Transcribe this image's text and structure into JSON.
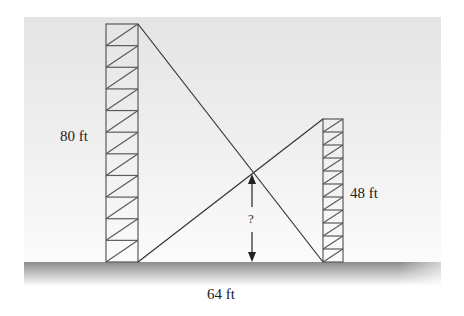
{
  "diagram": {
    "labels": {
      "left_tower_height": "80 ft",
      "right_tower_height": "48 ft",
      "ground_distance": "64 ft",
      "unknown_height": "?"
    },
    "values": {
      "left_tower_ft": 80,
      "right_tower_ft": 48,
      "distance_ft": 64
    },
    "colors": {
      "tower_stroke": "#555555",
      "wire_stroke": "#333333",
      "ground_top": "#8a8a8a",
      "background_top": "#e6e6e6"
    }
  }
}
